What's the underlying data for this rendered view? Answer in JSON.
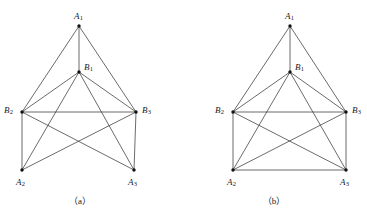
{
  "figure": {
    "background_color": "#ffffff",
    "line_color": "#3a3a3a",
    "vertex_color": "#111111",
    "text_color": "#1a1a1a",
    "panels": [
      {
        "id": "panel-a",
        "caption": "（a）",
        "caption_x": 80,
        "caption_y": 197,
        "vertices": [
          {
            "id": "A1",
            "label": "A",
            "subscript": "1",
            "x": 79,
            "y": 26,
            "label_x": 74,
            "label_y": 12
          },
          {
            "id": "B1",
            "label": "B",
            "subscript": "1",
            "x": 79,
            "y": 72,
            "label_x": 84,
            "label_y": 63
          },
          {
            "id": "B2",
            "label": "B",
            "subscript": "2",
            "x": 22,
            "y": 112,
            "label_x": 4,
            "label_y": 106
          },
          {
            "id": "B3",
            "label": "B",
            "subscript": "3",
            "x": 136,
            "y": 112,
            "label_x": 142,
            "label_y": 106
          },
          {
            "id": "A2",
            "label": "A",
            "subscript": "2",
            "x": 22,
            "y": 170,
            "label_x": 16,
            "label_y": 178
          },
          {
            "id": "A3",
            "label": "A",
            "subscript": "3",
            "x": 134,
            "y": 170,
            "label_x": 128,
            "label_y": 178
          }
        ],
        "edges": [
          [
            "A1",
            "B2"
          ],
          [
            "A1",
            "B1"
          ],
          [
            "A1",
            "B3"
          ],
          [
            "B1",
            "B2"
          ],
          [
            "B1",
            "B3"
          ],
          [
            "B1",
            "A2"
          ],
          [
            "B1",
            "A3"
          ],
          [
            "B2",
            "B3"
          ],
          [
            "B2",
            "A2"
          ],
          [
            "B2",
            "A3"
          ],
          [
            "B3",
            "A2"
          ],
          [
            "B3",
            "A3"
          ]
        ]
      },
      {
        "id": "panel-b",
        "caption": "（b）",
        "caption_x": 274,
        "caption_y": 197,
        "vertices": [
          {
            "id": "A1",
            "label": "A",
            "subscript": "1",
            "x": 290,
            "y": 26,
            "label_x": 285,
            "label_y": 12
          },
          {
            "id": "B1",
            "label": "B",
            "subscript": "1",
            "x": 290,
            "y": 72,
            "label_x": 295,
            "label_y": 63
          },
          {
            "id": "B2",
            "label": "B",
            "subscript": "2",
            "x": 233,
            "y": 112,
            "label_x": 215,
            "label_y": 106
          },
          {
            "id": "B3",
            "label": "B",
            "subscript": "3",
            "x": 346,
            "y": 112,
            "label_x": 352,
            "label_y": 106
          },
          {
            "id": "A2",
            "label": "A",
            "subscript": "2",
            "x": 233,
            "y": 170,
            "label_x": 227,
            "label_y": 178
          },
          {
            "id": "A3",
            "label": "A",
            "subscript": "3",
            "x": 346,
            "y": 170,
            "label_x": 340,
            "label_y": 178
          }
        ],
        "edges": [
          [
            "A1",
            "B2"
          ],
          [
            "A1",
            "B1"
          ],
          [
            "A1",
            "B3"
          ],
          [
            "B1",
            "B2"
          ],
          [
            "B1",
            "B3"
          ],
          [
            "B1",
            "A2"
          ],
          [
            "B1",
            "A3"
          ],
          [
            "B2",
            "B3"
          ],
          [
            "B2",
            "A2"
          ],
          [
            "B2",
            "A3"
          ],
          [
            "B3",
            "A2"
          ],
          [
            "B3",
            "A3"
          ],
          [
            "A2",
            "A3"
          ]
        ]
      }
    ]
  }
}
